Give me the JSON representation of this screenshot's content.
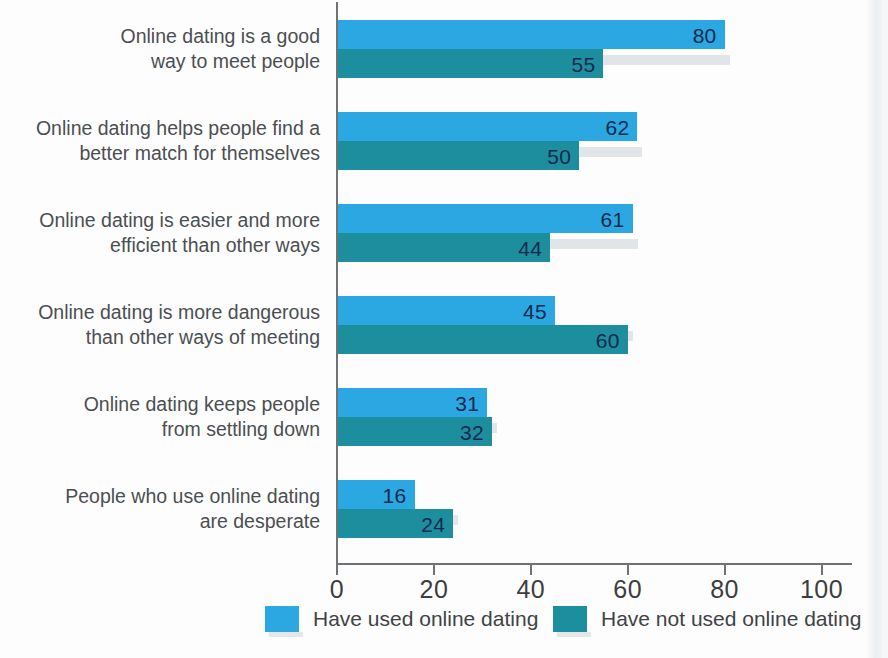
{
  "chart_data": {
    "type": "bar",
    "orientation": "horizontal",
    "title": "",
    "xlabel": "",
    "ylabel": "",
    "xlim": [
      0,
      110
    ],
    "xticks": [
      0,
      20,
      40,
      60,
      80,
      100
    ],
    "xtick_labels": [
      "0",
      "20",
      "40",
      "60",
      "80",
      "100"
    ],
    "grid": false,
    "legend_position": "bottom",
    "categories": [
      "Online dating is a good way to meet people",
      "Online dating helps people find a better match for themselves",
      "Online dating is easier and more efficient than other ways",
      "Online dating is more dangerous than other ways of meeting",
      "Online dating keeps people from settling down",
      "People who use online dating are desperate"
    ],
    "category_lines": [
      [
        "Online dating is a good",
        "way to meet people"
      ],
      [
        "Online dating helps people find a",
        "better match for themselves"
      ],
      [
        "Online dating is easier and more",
        "efficient than other ways"
      ],
      [
        "Online dating is more dangerous",
        "than other ways of meeting"
      ],
      [
        "Online dating keeps people",
        "from settling down"
      ],
      [
        "People who use online dating",
        "are desperate"
      ]
    ],
    "series": [
      {
        "name": "Have used online dating",
        "color": "#2ba7e2",
        "values": [
          80,
          62,
          61,
          45,
          31,
          16
        ]
      },
      {
        "name": "Have not used online dating",
        "color": "#1d8e9d",
        "values": [
          55,
          50,
          44,
          60,
          32,
          24
        ]
      }
    ]
  },
  "legend": {
    "items": [
      {
        "label": "Have used online dating",
        "color": "#2ba7e2"
      },
      {
        "label": "Have not used online dating",
        "color": "#1d8e9d"
      }
    ]
  },
  "colors": {
    "used": "#2ba7e2",
    "not_used": "#1d8e9d",
    "axis": "#6f7376",
    "value_text": "#152a4e",
    "label_text": "#4b4f52",
    "shadow": "#e2e5e7",
    "background": "#fdfdfd"
  }
}
